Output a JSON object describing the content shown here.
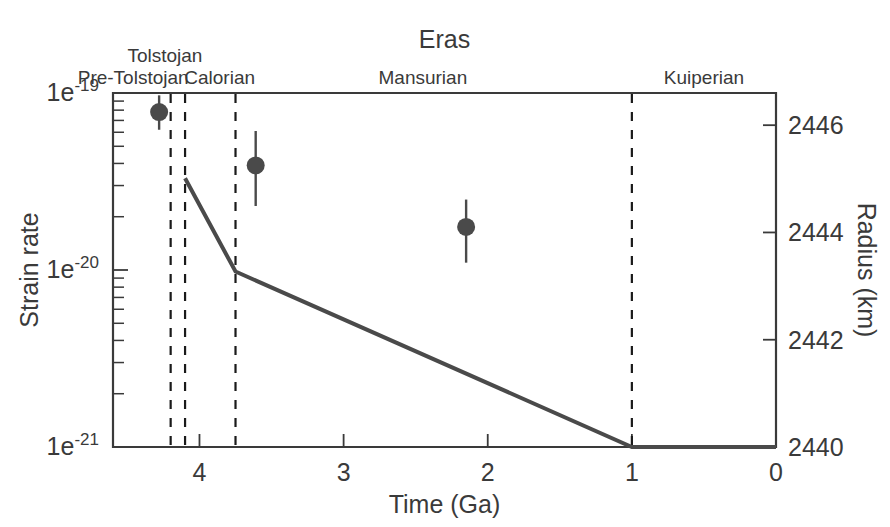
{
  "chart_data": {
    "type": "line",
    "title": "Eras",
    "xlabel": "Time (Ga)",
    "ylabel": "Strain rate",
    "ylabel_right": "Radius (km)",
    "xlim": [
      4.6,
      0
    ],
    "ylim": [
      1e-21,
      1e-19
    ],
    "yscale": "log",
    "ylim_right": [
      2440,
      2446.6
    ],
    "grid": false,
    "legend": null,
    "xticks": [
      "4",
      "3",
      "2",
      "1",
      "0"
    ],
    "xtick_values": [
      4,
      3,
      2,
      1,
      0
    ],
    "yticks": [
      "1e-21",
      "1e-20",
      "1e-19"
    ],
    "ytick_values": [
      1e-21,
      1e-20,
      1e-19
    ],
    "ytick_mantissa": "1e",
    "ytick_exponents": [
      "-21",
      "-20",
      "-19"
    ],
    "yticks_right": [
      "2440",
      "2442",
      "2444",
      "2446"
    ],
    "ytick_right_values": [
      2440,
      2442,
      2444,
      2446
    ],
    "eras": [
      {
        "name": "Pre-Tolstojan",
        "start": 4.6,
        "end": 4.2,
        "label_x": 4.46,
        "label_row": 1
      },
      {
        "name": "Tolstojan",
        "start": 4.2,
        "end": 4.1,
        "label_x": 4.24,
        "label_row": 0
      },
      {
        "name": "Calorian",
        "start": 4.1,
        "end": 3.75,
        "label_x": 3.86,
        "label_row": 1
      },
      {
        "name": "Mansurian",
        "start": 3.75,
        "end": 1.0,
        "label_x": 2.45,
        "label_row": 1
      },
      {
        "name": "Kuiperian",
        "start": 1.0,
        "end": 0.0,
        "label_x": 0.5,
        "label_row": 1
      }
    ],
    "era_boundaries": [
      4.2,
      4.1,
      3.75,
      1.0
    ],
    "series": [
      {
        "name": "Strain rate estimates",
        "type": "scatter-errorbar",
        "marker": "filled-circle",
        "color": "#4a4a4a",
        "points": [
          {
            "x": 4.28,
            "y": 7.8e-20,
            "yerr_low": 6.2e-20,
            "yerr_high": 9.7e-20
          },
          {
            "x": 3.61,
            "y": 3.9e-20,
            "yerr_low": 2.3e-20,
            "yerr_high": 6.1e-20
          },
          {
            "x": 2.15,
            "y": 1.75e-20,
            "yerr_low": 1.1e-20,
            "yerr_high": 2.5e-20
          }
        ]
      },
      {
        "name": "Thermal contraction model",
        "type": "line",
        "color": "#4a4a4a",
        "x": [
          4.1,
          3.75,
          1.0,
          0.0
        ],
        "y": [
          3.3e-20,
          9.8e-21,
          1e-21,
          1e-21
        ]
      }
    ]
  },
  "labels": {
    "title": "Eras",
    "xaxis": "Time (Ga)",
    "yaxis_left": "Strain rate",
    "yaxis_right": "Radius (km)"
  }
}
